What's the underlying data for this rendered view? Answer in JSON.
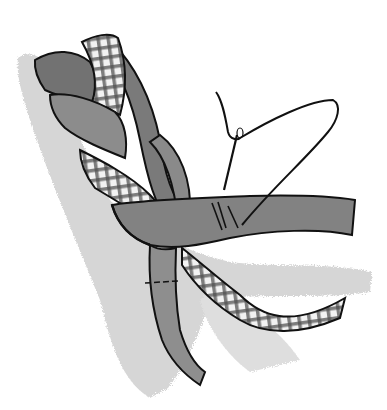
{
  "image": {
    "title": "Braided fabric strips with needle and thread",
    "subject": "three-strand braid of fabric strips (solid and gingham) with a threaded needle stitching the end",
    "colors": {
      "background": "#ffffff",
      "shadow_wash": "#d4d4d4",
      "dark_strip": "#7a7a7a",
      "mid_strip": "#8e8e8e",
      "light_strip": "#a6a6a6",
      "check_grid": "#6a6a6a",
      "check_light": "#f2f2f2",
      "outline": "#111111"
    },
    "elements": [
      "braid",
      "gingham-strip",
      "solid-strip",
      "needle",
      "thread",
      "stitches",
      "watercolor-shadow"
    ]
  }
}
